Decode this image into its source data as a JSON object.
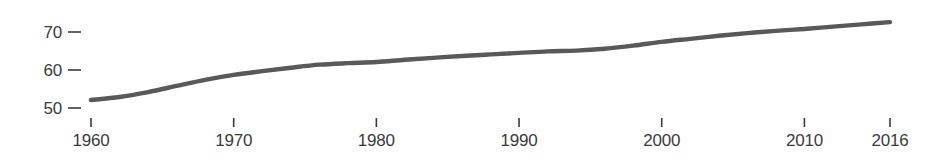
{
  "chart_data": {
    "type": "line",
    "title": "",
    "subtitle": "",
    "xlabel": "",
    "ylabel": "",
    "xlim": [
      1960,
      2016
    ],
    "ylim": [
      47,
      75
    ],
    "grid": false,
    "legend": null,
    "legend_position": "none",
    "x_ticks": [
      1960,
      1970,
      1980,
      1990,
      2000,
      2010,
      2016
    ],
    "x_tick_labels": [
      "1960",
      "1970",
      "1980",
      "1990",
      "2000",
      "2010",
      "2016"
    ],
    "y_ticks": [
      50,
      60,
      70
    ],
    "y_tick_labels": [
      "50",
      "60",
      "70"
    ],
    "series": [
      {
        "name": "series-1",
        "color": "#595959",
        "line_width": 4.4,
        "x": [
          1960,
          1962,
          1964,
          1966,
          1968,
          1970,
          1972,
          1974,
          1976,
          1978,
          1980,
          1982,
          1984,
          1986,
          1988,
          1990,
          1992,
          1994,
          1996,
          1998,
          2000,
          2002,
          2004,
          2006,
          2008,
          2010,
          2012,
          2014,
          2016
        ],
        "values": [
          52.1,
          52.9,
          54.2,
          55.8,
          57.4,
          58.7,
          59.7,
          60.6,
          61.4,
          61.8,
          62.1,
          62.7,
          63.2,
          63.7,
          64.1,
          64.5,
          64.9,
          65.1,
          65.6,
          66.4,
          67.4,
          68.2,
          69.0,
          69.7,
          70.3,
          70.8,
          71.4,
          72.0,
          72.6
        ]
      }
    ]
  },
  "axes": {
    "y_tick_dash": "–",
    "x_tick_dash": "|"
  },
  "colors": {
    "line": "#595959",
    "text": "#3b3b3b",
    "background": "#ffffff"
  }
}
